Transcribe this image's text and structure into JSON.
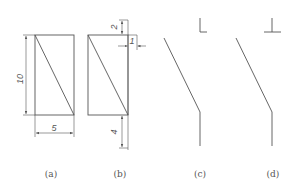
{
  "colors": {
    "background": "#ffffff",
    "stroke": "#555555",
    "text": "#555555"
  },
  "figures": [
    {
      "id": "a",
      "caption": "(a)",
      "dimensions": {
        "height": "10",
        "width": "5"
      }
    },
    {
      "id": "b",
      "caption": "(b)",
      "dimensions": {
        "top_offset": "2",
        "side_offset": "1",
        "bottom_extension": "4"
      }
    },
    {
      "id": "c",
      "caption": "(c)",
      "symbol": "corner-bracket-icon"
    },
    {
      "id": "d",
      "caption": "(d)",
      "symbol": "up-tack-icon"
    }
  ]
}
